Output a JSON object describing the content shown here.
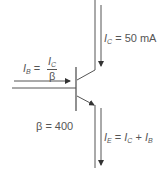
{
  "diagram": {
    "type": "npn-transistor-current-relations",
    "labels": {
      "collector_current": {
        "symbol": "I",
        "sub": "C",
        "rest": " = 50 mA"
      },
      "base_current": {
        "symbol": "I",
        "sub": "B",
        "eq": " = ",
        "num_symbol": "I",
        "num_sub": "C",
        "den": "β"
      },
      "gain": "β = 400",
      "emitter_current": {
        "symbol": "I",
        "sub": "E",
        "eq": " = ",
        "t1": "I",
        "t1_sub": "C",
        "plus": " + ",
        "t2": "I",
        "t2_sub": "B"
      }
    },
    "colors": {
      "line": "#555555",
      "background": "#ffffff"
    }
  }
}
